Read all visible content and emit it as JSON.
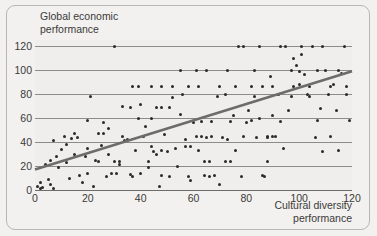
{
  "figure": {
    "background_color": "#f2f1ef",
    "panel_color": "#efeeec",
    "border_color": "#b8b6b2",
    "grid_color": "#8d8b87",
    "point_color": "#2b2a28",
    "trend_color": "#6e6c68"
  },
  "chart_data": {
    "type": "scatter",
    "title": "",
    "xlabel": "Cultural diversity\nperformance",
    "ylabel": "Global economic\nperformance",
    "xlim": [
      0,
      120
    ],
    "ylim": [
      0,
      125
    ],
    "xticks": [
      0,
      20,
      40,
      60,
      80,
      100,
      120
    ],
    "yticks": [
      0,
      20,
      40,
      60,
      80,
      100,
      120
    ],
    "xtick_labels": [
      "0",
      "20",
      "40",
      "60",
      "80",
      "100",
      "120"
    ],
    "ytick_labels": [
      "0",
      "20",
      "40",
      "60",
      "80",
      "100",
      "120"
    ],
    "grid": "horizontal",
    "legend": "none",
    "trendline": {
      "type": "linear",
      "x_start": 0,
      "y_start": 17,
      "x_end": 120,
      "y_end": 99,
      "color": "#6e6c68",
      "width": 2.6
    },
    "points": [
      [
        1,
        3
      ],
      [
        2,
        1
      ],
      [
        2,
        6
      ],
      [
        3,
        2
      ],
      [
        4,
        21
      ],
      [
        5,
        9
      ],
      [
        6,
        5
      ],
      [
        6,
        25
      ],
      [
        7,
        1
      ],
      [
        7,
        41
      ],
      [
        8,
        28
      ],
      [
        9,
        19
      ],
      [
        10,
        34
      ],
      [
        11,
        45
      ],
      [
        12,
        38
      ],
      [
        12,
        23
      ],
      [
        13,
        10
      ],
      [
        14,
        43
      ],
      [
        15,
        47
      ],
      [
        15,
        30
      ],
      [
        16,
        44
      ],
      [
        17,
        12
      ],
      [
        18,
        6
      ],
      [
        19,
        28
      ],
      [
        20,
        35
      ],
      [
        20,
        14
      ],
      [
        21,
        78
      ],
      [
        22,
        3
      ],
      [
        23,
        25
      ],
      [
        24,
        24
      ],
      [
        25,
        37
      ],
      [
        26,
        56
      ],
      [
        27,
        11
      ],
      [
        28,
        51
      ],
      [
        28,
        30
      ],
      [
        29,
        14
      ],
      [
        30,
        120
      ],
      [
        31,
        14
      ],
      [
        32,
        21
      ],
      [
        33,
        45
      ],
      [
        34,
        41
      ],
      [
        35,
        42
      ],
      [
        36,
        13
      ],
      [
        37,
        11
      ],
      [
        38,
        33
      ],
      [
        39,
        60
      ],
      [
        40,
        14
      ],
      [
        41,
        45
      ],
      [
        42,
        53
      ],
      [
        43,
        19
      ],
      [
        44,
        60
      ],
      [
        45,
        32
      ],
      [
        46,
        30
      ],
      [
        47,
        3
      ],
      [
        48,
        33
      ],
      [
        48,
        12
      ],
      [
        49,
        46
      ],
      [
        50,
        32
      ],
      [
        51,
        11
      ],
      [
        52,
        77
      ],
      [
        53,
        35
      ],
      [
        54,
        20
      ],
      [
        55,
        63
      ],
      [
        56,
        80
      ],
      [
        57,
        42
      ],
      [
        58,
        11
      ],
      [
        59,
        8
      ],
      [
        60,
        56
      ],
      [
        61,
        100
      ],
      [
        62,
        33
      ],
      [
        63,
        57
      ],
      [
        64,
        12
      ],
      [
        65,
        44
      ],
      [
        66,
        11
      ],
      [
        67,
        57
      ],
      [
        68,
        12
      ],
      [
        69,
        78
      ],
      [
        70,
        5
      ],
      [
        71,
        44
      ],
      [
        72,
        80
      ],
      [
        73,
        42
      ],
      [
        74,
        57
      ],
      [
        75,
        62
      ],
      [
        76,
        33
      ],
      [
        77,
        120
      ],
      [
        78,
        11
      ],
      [
        79,
        45
      ],
      [
        80,
        56
      ],
      [
        81,
        66
      ],
      [
        82,
        58
      ],
      [
        83,
        78
      ],
      [
        84,
        44
      ],
      [
        85,
        60
      ],
      [
        86,
        12
      ],
      [
        87,
        11
      ],
      [
        88,
        44
      ],
      [
        89,
        95
      ],
      [
        90,
        62
      ],
      [
        91,
        45
      ],
      [
        92,
        80
      ],
      [
        93,
        57
      ],
      [
        94,
        35
      ],
      [
        95,
        120
      ],
      [
        96,
        66
      ],
      [
        97,
        78
      ],
      [
        98,
        110
      ],
      [
        99,
        104
      ],
      [
        100,
        99
      ],
      [
        100,
        88
      ],
      [
        101,
        113
      ],
      [
        102,
        96
      ],
      [
        103,
        80
      ],
      [
        104,
        78
      ],
      [
        105,
        120
      ],
      [
        106,
        44
      ],
      [
        107,
        58
      ],
      [
        108,
        68
      ],
      [
        109,
        32
      ],
      [
        110,
        100
      ],
      [
        111,
        80
      ],
      [
        112,
        45
      ],
      [
        113,
        88
      ],
      [
        114,
        66
      ],
      [
        115,
        33
      ],
      [
        116,
        97
      ],
      [
        117,
        120
      ],
      [
        118,
        80
      ],
      [
        119,
        58
      ],
      [
        44,
        36
      ],
      [
        57,
        36
      ],
      [
        59,
        36
      ],
      [
        64,
        24
      ],
      [
        66,
        24
      ],
      [
        72,
        24
      ],
      [
        74,
        24
      ],
      [
        88,
        24
      ],
      [
        46,
        69
      ],
      [
        48,
        69
      ],
      [
        51,
        69
      ],
      [
        36,
        69
      ],
      [
        33,
        70
      ],
      [
        40,
        71
      ],
      [
        24,
        47
      ],
      [
        26,
        47
      ],
      [
        30,
        24
      ],
      [
        32,
        24
      ],
      [
        20,
        58
      ],
      [
        43,
        24
      ],
      [
        61,
        45
      ],
      [
        63,
        45
      ],
      [
        67,
        45
      ],
      [
        88,
        45
      ],
      [
        90,
        45
      ],
      [
        37,
        86
      ],
      [
        39,
        86
      ],
      [
        44,
        86
      ],
      [
        48,
        86
      ],
      [
        52,
        86
      ],
      [
        58,
        86
      ],
      [
        62,
        86
      ],
      [
        70,
        86
      ],
      [
        76,
        86
      ],
      [
        82,
        86
      ],
      [
        86,
        86
      ],
      [
        90,
        86
      ],
      [
        98,
        86
      ],
      [
        104,
        86
      ],
      [
        112,
        86
      ],
      [
        118,
        86
      ],
      [
        55,
        100
      ],
      [
        65,
        100
      ],
      [
        73,
        100
      ],
      [
        83,
        100
      ],
      [
        97,
        100
      ],
      [
        107,
        100
      ],
      [
        115,
        100
      ],
      [
        79,
        120
      ],
      [
        85,
        120
      ],
      [
        93,
        120
      ],
      [
        101,
        120
      ],
      [
        109,
        120
      ]
    ]
  }
}
